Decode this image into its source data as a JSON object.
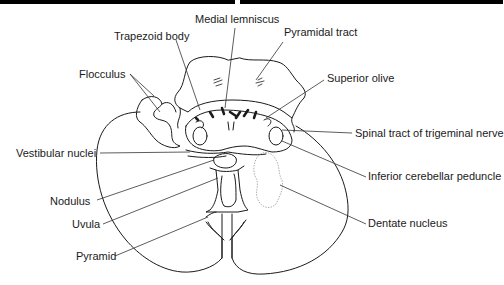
{
  "diagram": {
    "labels": {
      "medial_lemniscus": "Medial lemniscus",
      "trapezoid_body": "Trapezoid body",
      "pyramidal_tract": "Pyramidal tract",
      "flocculus": "Flocculus",
      "superior_olive": "Superior olive",
      "spinal_tract_trigeminal": "Spinal tract of trigeminal nerve",
      "vestibular_nuclei": "Vestibular nuclei",
      "inferior_cerebellar_peduncle": "Inferior cerebellar peduncle",
      "nodulus": "Nodulus",
      "uvula": "Uvula",
      "dentate_nucleus": "Dentate nucleus",
      "pyramid": "Pyramid"
    },
    "colors": {
      "line": "#1a1a1a",
      "leader": "#333333",
      "dentate": "#b0b0b0",
      "top_bar": "#000000"
    }
  }
}
